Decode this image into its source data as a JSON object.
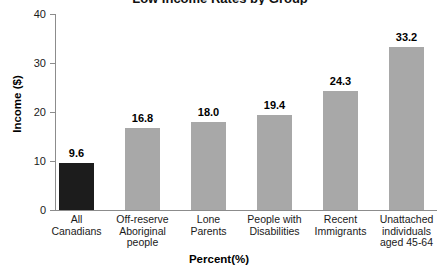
{
  "title": {
    "text": "Low Income Rates by Group",
    "note": "cropped at top edge"
  },
  "axes": {
    "y_label": "Income ($)",
    "x_label": "Percent(%)",
    "y_ticks": [
      "0",
      "10",
      "20",
      "30",
      "40"
    ],
    "y_min": 0,
    "y_max": 40
  },
  "colors": {
    "highlight_bar": "#1c1c1c",
    "bar": "#a8a8a8",
    "axis": "#8c8c8c",
    "text": "#111111",
    "background": "#ffffff"
  },
  "chart_data": {
    "type": "bar",
    "title": "Low Income Rates by Group",
    "xlabel": "Percent(%)",
    "ylabel": "Income ($)",
    "ylim": [
      0,
      40
    ],
    "yticks": [
      0,
      10,
      20,
      30,
      40
    ],
    "grid": false,
    "legend": null,
    "categories": [
      "All\nCanadians",
      "Off-reserve\nAboriginal\npeople",
      "Lone\nParents",
      "People with\nDisabilities",
      "Recent\nImmigrants",
      "Unattached\nindividuals\naged 45-64"
    ],
    "values": [
      9.6,
      16.8,
      18.0,
      19.4,
      24.3,
      33.2
    ],
    "value_labels": [
      "9.6",
      "16.8",
      "18.0",
      "19.4",
      "24.3",
      "33.2"
    ],
    "bar_colors": [
      "#1c1c1c",
      "#a8a8a8",
      "#a8a8a8",
      "#a8a8a8",
      "#a8a8a8",
      "#a8a8a8"
    ]
  },
  "bars": [
    {
      "label_lines": [
        "All",
        "Canadians"
      ],
      "value_label": "9.6",
      "value": 9.6,
      "color": "#1c1c1c",
      "x": 59,
      "width": 35
    },
    {
      "label_lines": [
        "Off-reserve",
        "Aboriginal",
        "people"
      ],
      "value_label": "16.8",
      "value": 16.8,
      "color": "#a8a8a8",
      "x": 125,
      "width": 35
    },
    {
      "label_lines": [
        "Lone",
        "Parents"
      ],
      "value_label": "18.0",
      "value": 18.0,
      "color": "#a8a8a8",
      "x": 191,
      "width": 35
    },
    {
      "label_lines": [
        "People with",
        "Disabilities"
      ],
      "value_label": "19.4",
      "value": 19.4,
      "color": "#a8a8a8",
      "x": 257,
      "width": 35
    },
    {
      "label_lines": [
        "Recent",
        "Immigrants"
      ],
      "value_label": "24.3",
      "value": 24.3,
      "color": "#a8a8a8",
      "x": 323,
      "width": 35
    },
    {
      "label_lines": [
        "Unattached",
        "individuals",
        "aged 45-64"
      ],
      "value_label": "33.2",
      "value": 33.2,
      "color": "#a8a8a8",
      "x": 389,
      "width": 35
    }
  ]
}
